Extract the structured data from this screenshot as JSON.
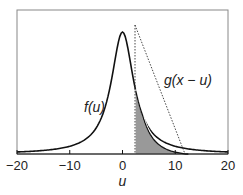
{
  "chart_data": {
    "type": "line",
    "title": "",
    "xlabel": "u",
    "ylabel": "",
    "xlim": [
      -20,
      20
    ],
    "xticks": [
      "-20",
      "-10",
      "0",
      "10",
      "20"
    ],
    "series": [
      {
        "name": "f(u)",
        "style": "solid",
        "shape": "peaked (Lorentzian-like) centered at u=0"
      },
      {
        "name": "g(x − u)",
        "style": "dotted",
        "shape": "triangle with vertical edge at u≈2.5 and falling to zero at u≈12"
      }
    ],
    "annotations": [
      "f(u)",
      "g(x − u)",
      "shaded overlap region from u≈2.5 to u≈12"
    ]
  },
  "labels": {
    "f": "f(u)",
    "g": "g(x − u)",
    "x_axis": "u",
    "ticks": [
      "−20",
      "−10",
      "0",
      "10",
      "20"
    ]
  }
}
